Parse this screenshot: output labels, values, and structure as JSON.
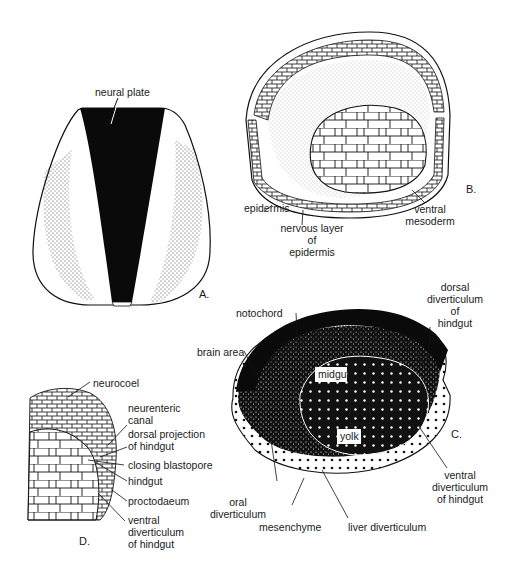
{
  "figure": {
    "panels": [
      {
        "id": "A",
        "label": "A.",
        "labels": [
          "neural plate"
        ]
      },
      {
        "id": "B",
        "label": "B.",
        "labels": [
          "epidermis",
          "nervous layer of epidermis",
          "ventral mesoderm"
        ]
      },
      {
        "id": "C",
        "label": "C.",
        "labels": [
          "notochord",
          "dorsal diverticulum of hindgut",
          "brain area",
          "midgut",
          "yolk",
          "ventral diverticulum of hindgut",
          "oral diverticulum",
          "mesenchyme",
          "liver diverticulum"
        ]
      },
      {
        "id": "D",
        "label": "D.",
        "labels": [
          "neurocoel",
          "neurenteric canal",
          "dorsal projection of hindgut",
          "closing blastopore",
          "hindgut",
          "proctodaeum",
          "ventral diverticulum of hindgut"
        ]
      }
    ]
  },
  "a": {
    "panel": "A.",
    "neural_plate": "neural plate"
  },
  "b": {
    "panel": "B.",
    "epidermis": "epidermis",
    "nervous1": "nervous layer",
    "nervous2": "of",
    "nervous3": "epidermis",
    "ventral1": "ventral",
    "ventral2": "mesoderm"
  },
  "c": {
    "panel": "C.",
    "notochord": "notochord",
    "dorsal1": "dorsal",
    "dorsal2": "diverticulum",
    "dorsal3": "of",
    "dorsal4": "hindgut",
    "brain": "brain area",
    "midgut": "midgut",
    "yolk": "yolk",
    "ventral1": "ventral",
    "ventral2": "diverticulum",
    "ventral3": "of hindgut",
    "oral1": "oral",
    "oral2": "diverticulum",
    "mesenchyme": "mesenchyme",
    "liver": "liver diverticulum"
  },
  "d": {
    "panel": "D.",
    "neurocoel": "neurocoel",
    "neurenteric1": "neurenteric",
    "neurenteric2": "canal",
    "dorsalproj1": "dorsal projection",
    "dorsalproj2": "of hindgut",
    "closing": "closing blastopore",
    "hindgut": "hindgut",
    "proctodaeum": "proctodaeum",
    "ventral1": "ventral",
    "ventral2": "diverticulum",
    "ventral3": "of hindgut"
  }
}
